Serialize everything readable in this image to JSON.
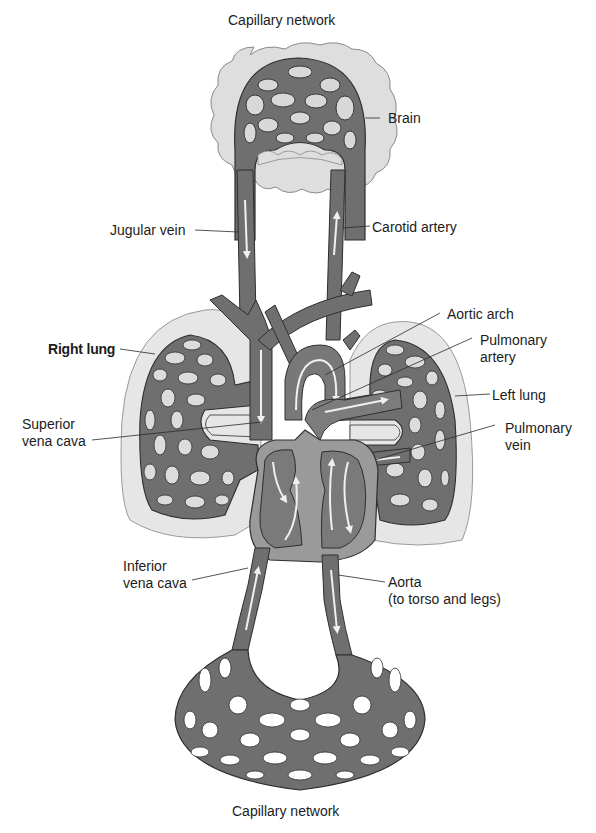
{
  "figure": {
    "colors": {
      "vessel": "#6f6f6f",
      "vessel_outline": "#2e2e2e",
      "tissue": "#dcdcdc",
      "tissue_outline": "#8a8a8a",
      "lung_halo": "#e6e6e6",
      "heart_wall": "#9a9a9a",
      "heart_chamber": "#7a7a7a",
      "flow_arrow": "#f0f0f0",
      "background": "#ffffff",
      "text": "#1c1c1c"
    }
  },
  "labels": {
    "capillary_top": "Capillary network",
    "brain": "Brain",
    "jugular_vein": "Jugular vein",
    "carotid_artery": "Carotid artery",
    "aortic_arch": "Aortic arch",
    "pulmonary_artery": [
      "Pulmonary",
      "artery"
    ],
    "right_lung": "Right lung",
    "left_lung": "Left lung",
    "superior_vena_cava": [
      "Superior",
      "vena cava"
    ],
    "pulmonary_vein": [
      "Pulmonary",
      "vein"
    ],
    "inferior_vena_cava": [
      "Inferior",
      "vena cava"
    ],
    "aorta": [
      "Aorta",
      "(to torso and legs)"
    ],
    "capillary_bottom": "Capillary network"
  }
}
